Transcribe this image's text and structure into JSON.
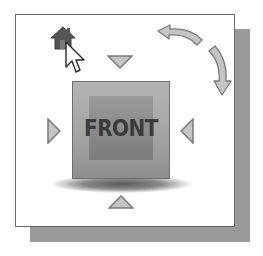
{
  "widget": {
    "name": "ViewCube",
    "face_label": "FRONT",
    "colors": {
      "frame_border": "#6a6a6a",
      "frame_background": "#ffffff",
      "shadow": "#9a9a9a",
      "cube_face": "#a8a8a8",
      "cube_inner": "#8a8a8a",
      "label_text": "#3a3a3a",
      "arrow_fill": "#c4c4c4",
      "arrow_stroke": "#7a7a7a",
      "home_fill": "#555555"
    }
  },
  "controls": {
    "home": {
      "icon": "home-icon"
    },
    "arrow_top": {
      "icon": "triangle-down-icon"
    },
    "arrow_bottom": {
      "icon": "triangle-up-icon"
    },
    "arrow_left": {
      "icon": "triangle-right-icon"
    },
    "arrow_right": {
      "icon": "triangle-left-icon"
    },
    "rotate_ccw": {
      "icon": "rotate-counterclockwise-icon"
    },
    "rotate_cw": {
      "icon": "rotate-clockwise-icon"
    }
  },
  "cursor": {
    "icon": "mouse-pointer-icon"
  }
}
